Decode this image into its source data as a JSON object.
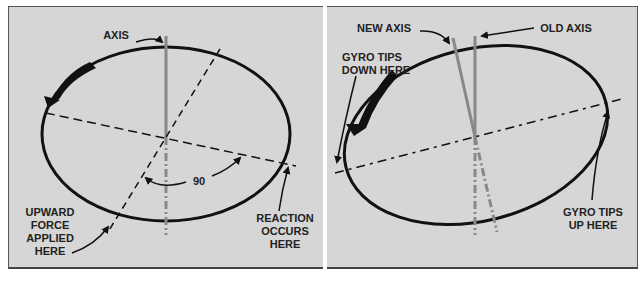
{
  "left_diagram": {
    "labels": {
      "axis": "AXIS",
      "angle": "90",
      "upward_force": [
        "UPWARD",
        "FORCE",
        "APPLIED",
        "HERE"
      ],
      "reaction": [
        "REACTION",
        "OCCURS",
        "HERE"
      ]
    }
  },
  "right_diagram": {
    "labels": {
      "new_axis": "NEW AXIS",
      "old_axis": "OLD AXIS",
      "tips_down": [
        "GYRO TIPS",
        "DOWN HERE"
      ],
      "tips_up": [
        "GYRO TIPS",
        "UP HERE"
      ]
    }
  },
  "colors": {
    "background": "#d6d6d6",
    "ellipse": "#111111",
    "axis_line": "#888888"
  }
}
